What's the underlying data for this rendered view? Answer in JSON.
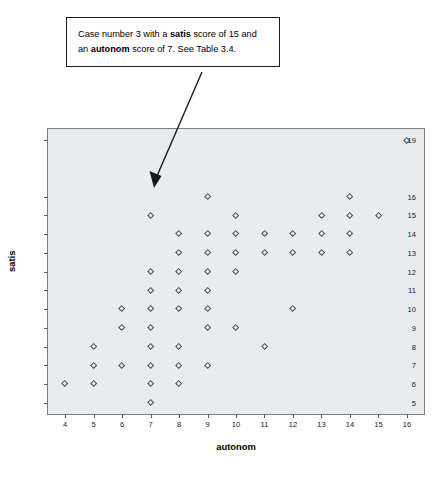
{
  "annotation": {
    "line1_a": "Case number 3 with a ",
    "line1_b": "satis",
    "line1_c": " score of 15 and",
    "line2_a": "an ",
    "line2_b": "autonom",
    "line2_c": " score of 7. See Table 3.4.",
    "points_to_x": 7,
    "points_to_y": 15
  },
  "chart_data": {
    "type": "scatter",
    "title": "",
    "xlabel": "autonom",
    "ylabel": "satis",
    "xlim": [
      3.4,
      16.6
    ],
    "ylim": [
      4.4,
      19.6
    ],
    "xticks": [
      4,
      5,
      6,
      7,
      8,
      9,
      10,
      11,
      12,
      13,
      14,
      15,
      16
    ],
    "yticks": [
      5,
      6,
      7,
      8,
      9,
      10,
      11,
      12,
      13,
      14,
      15,
      16,
      19
    ],
    "grid": false,
    "legend": null,
    "marker": "open-diamond",
    "marker_color": "#4a4f57",
    "plot_background": "#e8ecef",
    "points": [
      {
        "x": 4,
        "y": 6
      },
      {
        "x": 5,
        "y": 8
      },
      {
        "x": 5,
        "y": 7
      },
      {
        "x": 5,
        "y": 6
      },
      {
        "x": 6,
        "y": 10
      },
      {
        "x": 6,
        "y": 9
      },
      {
        "x": 6,
        "y": 7
      },
      {
        "x": 7,
        "y": 15
      },
      {
        "x": 7,
        "y": 12
      },
      {
        "x": 7,
        "y": 11
      },
      {
        "x": 7,
        "y": 10
      },
      {
        "x": 7,
        "y": 9
      },
      {
        "x": 7,
        "y": 8
      },
      {
        "x": 7,
        "y": 7
      },
      {
        "x": 7,
        "y": 6
      },
      {
        "x": 7,
        "y": 5
      },
      {
        "x": 8,
        "y": 14
      },
      {
        "x": 8,
        "y": 13
      },
      {
        "x": 8,
        "y": 12
      },
      {
        "x": 8,
        "y": 11
      },
      {
        "x": 8,
        "y": 10
      },
      {
        "x": 8,
        "y": 8
      },
      {
        "x": 8,
        "y": 7
      },
      {
        "x": 8,
        "y": 6
      },
      {
        "x": 9,
        "y": 16
      },
      {
        "x": 9,
        "y": 14
      },
      {
        "x": 9,
        "y": 13
      },
      {
        "x": 9,
        "y": 12
      },
      {
        "x": 9,
        "y": 11
      },
      {
        "x": 9,
        "y": 10
      },
      {
        "x": 9,
        "y": 9
      },
      {
        "x": 9,
        "y": 7
      },
      {
        "x": 10,
        "y": 15
      },
      {
        "x": 10,
        "y": 14
      },
      {
        "x": 10,
        "y": 13
      },
      {
        "x": 10,
        "y": 12
      },
      {
        "x": 10,
        "y": 9
      },
      {
        "x": 11,
        "y": 14
      },
      {
        "x": 11,
        "y": 13
      },
      {
        "x": 11,
        "y": 8
      },
      {
        "x": 12,
        "y": 14
      },
      {
        "x": 12,
        "y": 13
      },
      {
        "x": 12,
        "y": 10
      },
      {
        "x": 13,
        "y": 15
      },
      {
        "x": 13,
        "y": 14
      },
      {
        "x": 13,
        "y": 13
      },
      {
        "x": 14,
        "y": 16
      },
      {
        "x": 14,
        "y": 15
      },
      {
        "x": 14,
        "y": 14
      },
      {
        "x": 14,
        "y": 13
      },
      {
        "x": 15,
        "y": 15
      },
      {
        "x": 16,
        "y": 19
      }
    ]
  }
}
